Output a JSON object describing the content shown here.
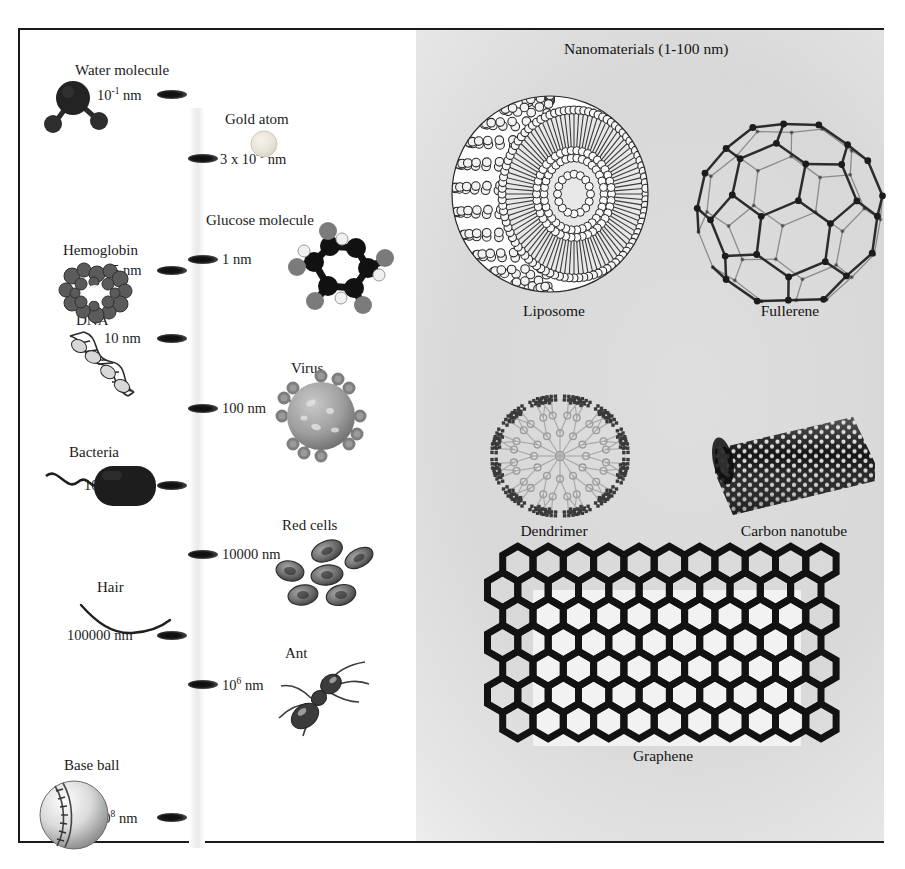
{
  "title": "Nanomaterials (1-100 nm)",
  "scale_items": [
    {
      "name": "Water molecule",
      "value": "10",
      "exp": "-1",
      "unit": " nm",
      "side": "left",
      "icon": "water-molecule-icon"
    },
    {
      "name": "Gold atom",
      "value": "3 x 10",
      "exp": "-1",
      "unit": " nm",
      "side": "right",
      "icon": "gold-atom-icon"
    },
    {
      "name": "Glucose molecule",
      "value": "1",
      "exp": "",
      "unit": " nm",
      "side": "right",
      "icon": "glucose-molecule-icon"
    },
    {
      "name": "Hemoglobin",
      "value": "5",
      "exp": "",
      "unit": " nm",
      "side": "left",
      "icon": "hemoglobin-icon"
    },
    {
      "name": "DNA",
      "value": "10",
      "exp": "",
      "unit": " nm",
      "side": "left",
      "icon": "dna-icon"
    },
    {
      "name": "Virus",
      "value": "100",
      "exp": "",
      "unit": " nm",
      "side": "right",
      "icon": "virus-icon"
    },
    {
      "name": "Bacteria",
      "value": "1000",
      "exp": "",
      "unit": " nm",
      "side": "left",
      "icon": "bacteria-icon"
    },
    {
      "name": "Red cells",
      "value": "10000",
      "exp": "",
      "unit": " nm",
      "side": "right",
      "icon": "red-blood-cells-icon"
    },
    {
      "name": "Hair",
      "value": "100000",
      "exp": "",
      "unit": " nm",
      "side": "left",
      "icon": "hair-icon"
    },
    {
      "name": "Ant",
      "value": "10",
      "exp": "6",
      "unit": " nm",
      "side": "right",
      "icon": "ant-icon"
    },
    {
      "name": "Base ball",
      "value": "10",
      "exp": "8",
      "unit": " nm",
      "side": "left",
      "icon": "baseball-icon"
    }
  ],
  "nanomaterials": [
    {
      "label": "Liposome",
      "icon": "liposome-icon"
    },
    {
      "label": "Fullerene",
      "icon": "fullerene-icon"
    },
    {
      "label": "Dendrimer",
      "icon": "dendrimer-icon"
    },
    {
      "label": "Carbon nanotube",
      "icon": "carbon-nanotube-icon"
    },
    {
      "label": "Graphene",
      "icon": "graphene-icon"
    }
  ],
  "chart_data": {
    "type": "scatter",
    "title": "Nanomaterials (1-100 nm)",
    "xlabel": "",
    "ylabel": "Size (nm, logarithmic scale)",
    "categories": [
      "Water molecule",
      "Gold atom",
      "Glucose molecule",
      "Hemoglobin",
      "DNA",
      "Virus",
      "Bacteria",
      "Red cells",
      "Hair",
      "Ant",
      "Base ball"
    ],
    "values": [
      0.1,
      0.3,
      1,
      5,
      10,
      100,
      1000,
      10000,
      100000,
      1000000,
      100000000
    ],
    "value_labels": [
      "10^-1 nm",
      "3 x 10^-1 nm",
      "1 nm",
      "5 nm",
      "10 nm",
      "100 nm",
      "1000 nm",
      "10000 nm",
      "100000 nm",
      "10^6 nm",
      "10^8 nm"
    ],
    "grid": false,
    "legend": "none"
  }
}
